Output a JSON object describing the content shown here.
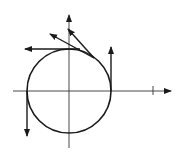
{
  "diagram": {
    "stroke_color": "#1a1a1a",
    "axes": {
      "x_axis": {
        "has_arrow": true,
        "tick_marks": 1
      },
      "y_axis": {
        "has_arrow": true
      }
    },
    "circle": {
      "center": "origin"
    },
    "tangent_vectors": [
      {
        "at": "right (0°)",
        "direction": "up"
      },
      {
        "at": "upper-right",
        "direction": "up-left"
      },
      {
        "at": "upper-right",
        "direction": "up-left (longer)"
      },
      {
        "at": "top (90°)",
        "direction": "left"
      },
      {
        "at": "left (180°)",
        "direction": "down"
      }
    ]
  }
}
